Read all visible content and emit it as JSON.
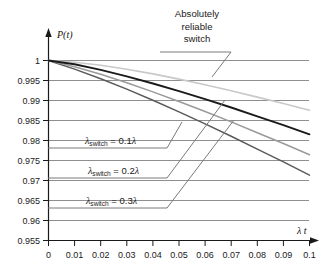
{
  "chart_data": {
    "type": "line",
    "title": "",
    "xlabel": "λ t",
    "ylabel": "P(t)",
    "xlim": [
      0,
      0.1
    ],
    "ylim": [
      0.955,
      1.0
    ],
    "grid": true,
    "legend_position": "inline-annotations",
    "x_ticks": [
      "0",
      "0.01",
      "0.02",
      "0.03",
      "0.04",
      "0.05",
      "0.06",
      "0.07",
      "0.08",
      "0.09",
      "0.1"
    ],
    "y_ticks": [
      "1",
      "0.995",
      "0.99",
      "0.985",
      "0.98",
      "0.975",
      "0.97",
      "0.965",
      "0.96",
      "0.955"
    ],
    "x": [
      0,
      0.01,
      0.02,
      0.03,
      0.04,
      0.05,
      0.06,
      0.07,
      0.08,
      0.09,
      0.1
    ],
    "series": [
      {
        "name": "Absolutely reliable switch",
        "color": "#c9c9c9",
        "values": [
          1.0,
          0.99955,
          0.9988,
          0.9978,
          0.99665,
          0.99535,
          0.99395,
          0.99245,
          0.99085,
          0.98925,
          0.98755
        ]
      },
      {
        "name": "λswitch = 0.1λ",
        "color": "#1a1a1a",
        "values": [
          1.0,
          0.99905,
          0.99765,
          0.99605,
          0.99425,
          0.99235,
          0.99035,
          0.98825,
          0.98605,
          0.98385,
          0.98155
        ]
      },
      {
        "name": "λswitch = 0.2λ",
        "color": "#9a9a9a",
        "values": [
          1.0,
          0.99845,
          0.99655,
          0.99445,
          0.99215,
          0.98975,
          0.98725,
          0.98465,
          0.98195,
          0.97925,
          0.97645
        ]
      },
      {
        "name": "λswitch = 0.3λ",
        "color": "#5a5a5a",
        "values": [
          1.0,
          0.99785,
          0.99545,
          0.99285,
          0.99005,
          0.98715,
          0.98415,
          0.98105,
          0.97785,
          0.97465,
          0.97135
        ]
      }
    ],
    "annotations": [
      {
        "id": "reliable",
        "text_lines": [
          "Absolutely",
          "reliable",
          "switch"
        ]
      },
      {
        "id": "s1",
        "text": "λswitch = 0.1λ",
        "lam_sub": "switch",
        "value": "0.1"
      },
      {
        "id": "s2",
        "text": "λswitch = 0.2λ",
        "lam_sub": "switch",
        "value": "0.2"
      },
      {
        "id": "s3",
        "text": "λswitch = 0.3λ",
        "lam_sub": "switch",
        "value": "0.3"
      }
    ]
  },
  "labels": {
    "y_axis": "P(t)",
    "x_axis": "λ t",
    "annotation_line1": "Absolutely",
    "annotation_line2": "reliable",
    "annotation_line3": "switch",
    "lambda_glyph": "λ",
    "switch_sub": "switch",
    "eq1": "= 0.1",
    "eq2": "= 0.2",
    "eq3": "= 0.3",
    "y0": "1",
    "y1": "0.995",
    "y2": "0.99",
    "y3": "0.985",
    "y4": "0.98",
    "y5": "0.975",
    "y6": "0.97",
    "y7": "0.965",
    "y8": "0.96",
    "y9": "0.955",
    "x0": "0",
    "x1": "0.01",
    "x2": "0.02",
    "x3": "0.03",
    "x4": "0.04",
    "x5": "0.05",
    "x6": "0.06",
    "x7": "0.07",
    "x8": "0.08",
    "x9": "0.09",
    "x10": "0.1"
  },
  "colors": {
    "grid": "#8f8f8f",
    "axis": "#1a1a1a",
    "curve_reliable": "#c9c9c9",
    "curve_01": "#1a1a1a",
    "curve_02": "#9a9a9a",
    "curve_03": "#5a5a5a",
    "leader": "#7a7a7a",
    "background": "#ffffff"
  }
}
